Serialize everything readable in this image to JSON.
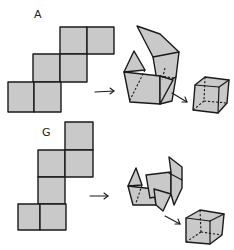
{
  "figure": {
    "panels": [
      {
        "label": "A",
        "net_squares": 6,
        "steps": [
          "flat net",
          "partially folded",
          "closed cube"
        ]
      },
      {
        "label": "G",
        "net_squares": 6,
        "steps": [
          "flat net",
          "partially folded",
          "closed cube"
        ]
      }
    ],
    "colors": {
      "face_fill": "#c9c9c9",
      "stroke": "#1a1a1a",
      "background": "#ffffff"
    }
  }
}
